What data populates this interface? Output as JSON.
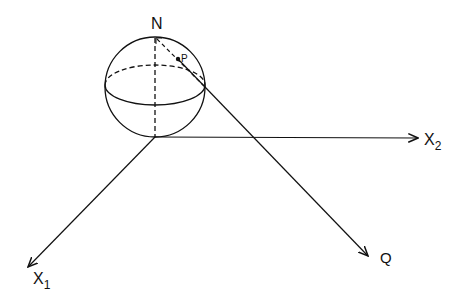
{
  "diagram": {
    "type": "stereographic-projection",
    "labels": {
      "north": "N",
      "point_p": "P",
      "point_q": "Q",
      "axis_x1_letter": "X",
      "axis_x1_sub": "1",
      "axis_x2_letter": "X",
      "axis_x2_sub": "2"
    },
    "colors": {
      "stroke": "#111111",
      "background": "#ffffff"
    }
  }
}
